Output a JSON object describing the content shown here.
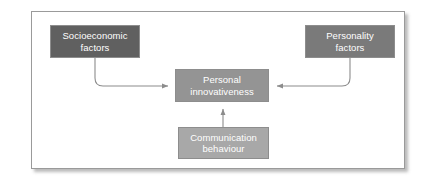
{
  "figure": {
    "type": "block-diagram",
    "background_color": "#ffffff",
    "frame": {
      "border_color": "#9a9a9a",
      "shadow_color": "#5a5a5a"
    },
    "nodes": [
      {
        "id": "socioeconomic",
        "label": "Socioeconomic\nfactors",
        "fill": "#606060",
        "text_color": "#ffffff"
      },
      {
        "id": "personality",
        "label": "Personality\nfactors",
        "fill": "#7a7a7a",
        "text_color": "#ffffff"
      },
      {
        "id": "personal_innovativeness",
        "label": "Personal\ninnovativeness",
        "fill": "#949494",
        "text_color": "#ffffff"
      },
      {
        "id": "communication",
        "label": "Communication\nbehaviour",
        "fill": "#a8a8a8",
        "text_color": "#ffffff"
      }
    ],
    "edges": [
      {
        "id": "socioeconomic-to-personal",
        "from": "socioeconomic",
        "to": "personal_innovativeness",
        "style": "elbow-curved",
        "direction": "down-then-right",
        "color": "#8c8c8c"
      },
      {
        "id": "personality-to-personal",
        "from": "personality",
        "to": "personal_innovativeness",
        "style": "elbow-curved",
        "direction": "down-then-left",
        "color": "#8c8c8c"
      },
      {
        "id": "communication-to-personal",
        "from": "communication",
        "to": "personal_innovativeness",
        "style": "straight",
        "direction": "up",
        "color": "#8c8c8c"
      }
    ]
  }
}
